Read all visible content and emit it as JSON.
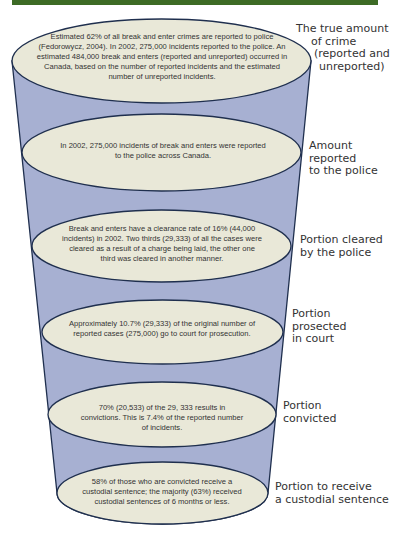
{
  "header_bar": {
    "color": "#3d6b25"
  },
  "colors": {
    "funnel_body": "#a7b0d2",
    "ellipse_fill": "#e9e8d8",
    "outline": "#1f2f4e",
    "text": "#333333"
  },
  "stages": [
    {
      "text": "Estimated 62% of all break and enter crimes are reported to police (Fedorowycz, 2004). In 2002, 275,000 incidents reported to the police. An estimated 484,000 break and enters (reported and unreported) occurred in Canada, based on the number of reported incidents and the estimated number of unreported incidents.",
      "label_lines": [
        "The true amount",
        "of crime",
        "(reported and",
        "unreported)"
      ]
    },
    {
      "text": "In 2002, 275,000 incidents of break and enters were reported to the police across Canada.",
      "label_lines": [
        "Amount",
        "reported",
        "to the police"
      ]
    },
    {
      "text": "Break and enters have a clearance rate of 16% (44,000 incidents) in 2002. Two thirds (29,333) of all the cases were cleared as a result of a charge being laid, the other one third was cleared in another manner.",
      "label_lines": [
        "Portion cleared",
        "by the police"
      ]
    },
    {
      "text": "Approximately 10.7% (29,333) of the original number of reported cases (275,000) go to court for prosecution.",
      "label_lines": [
        "Portion",
        "prosected",
        "in court"
      ]
    },
    {
      "text": "70% (20,533) of the 29, 333 results in convictions. This is 7.4% of the reported number of incidents.",
      "label_lines": [
        "Portion",
        "convicted"
      ]
    },
    {
      "text": "58% of those who are convicted receive a custodial sentence; the majority (63%) received custodial sentences of 6 months or less.",
      "label_lines": [
        "Portion to receive",
        "a custodial sentence"
      ]
    }
  ]
}
